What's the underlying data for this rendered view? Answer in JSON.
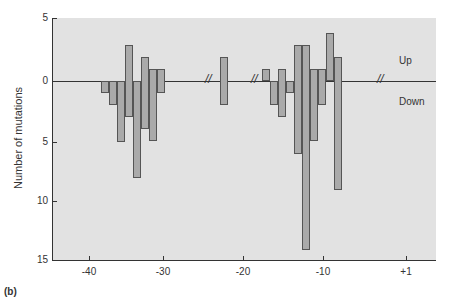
{
  "chart_data": {
    "type": "bar",
    "title": "",
    "xlabel": "",
    "ylabel": "Number of mutations",
    "ylim": [
      -15,
      5
    ],
    "y_ticks": [
      "5",
      "0",
      "5",
      "10",
      "15"
    ],
    "x_ticks": [
      "-40",
      "-30",
      "-20",
      "-10",
      "+1"
    ],
    "annotations": [
      "Up",
      "Down"
    ],
    "panel_label": "(b)",
    "series": [
      {
        "name": "Up",
        "positions": [
          -39,
          -38,
          -37,
          -36,
          -35,
          -34,
          -33,
          -32,
          -22,
          -17,
          -16,
          -15,
          -14,
          -13,
          -12,
          -11,
          -10,
          -9,
          -8
        ],
        "values": [
          0,
          0,
          0,
          3,
          0,
          2,
          1,
          1,
          2,
          1,
          0,
          1,
          0,
          3,
          3,
          1,
          1,
          4,
          2
        ]
      },
      {
        "name": "Down",
        "positions": [
          -39,
          -38,
          -37,
          -36,
          -35,
          -34,
          -33,
          -32,
          -22,
          -17,
          -16,
          -15,
          -14,
          -13,
          -12,
          -11,
          -10,
          -9,
          -8
        ],
        "values": [
          1,
          2,
          5,
          3,
          8,
          4,
          5,
          1,
          2,
          0,
          2,
          3,
          1,
          6,
          14,
          5,
          2,
          0,
          9
        ]
      }
    ]
  },
  "labels": {
    "up": "Up",
    "down": "Down",
    "ylabel": "Number of mutations",
    "panel": "(b)"
  }
}
